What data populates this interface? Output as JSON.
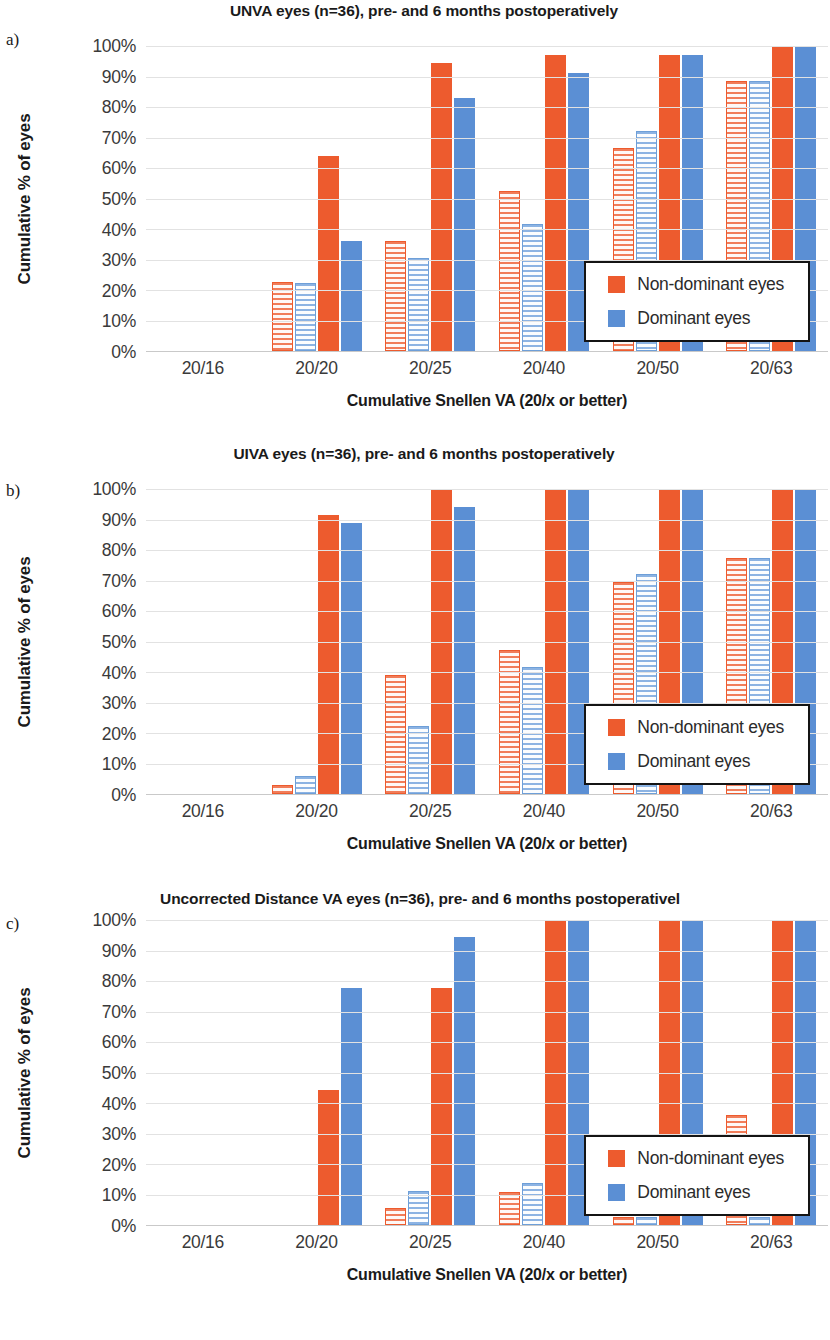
{
  "figure": {
    "panel_letters": [
      "a)",
      "b)",
      "c)"
    ]
  },
  "axis": {
    "ylabel": "Cumulative % of eyes",
    "xlabel": "Cumulative Snellen VA (20/x or better)",
    "yticks": [
      "0%",
      "10%",
      "20%",
      "30%",
      "40%",
      "50%",
      "60%",
      "70%",
      "80%",
      "90%",
      "100%"
    ],
    "xticks": [
      "20/16",
      "20/20",
      "20/25",
      "20/40",
      "20/50",
      "20/63"
    ]
  },
  "legend": {
    "items": [
      {
        "label": "Non-dominant eyes",
        "color": "#ed5b2e",
        "swatch": "nd"
      },
      {
        "label": "Dominant eyes",
        "color": "#5b8fd4",
        "swatch": "d"
      }
    ]
  },
  "colors": {
    "non_dominant": "#ed5b2e",
    "dominant": "#5b8fd4",
    "non_dominant_pre": "#f6a68f",
    "dominant_pre": "#bed8f2",
    "gridline": "#e2e2e2",
    "axis": "#c9c9c9"
  },
  "chart_data": [
    {
      "id": "panel-a",
      "type": "bar",
      "title": "UNVA eyes (n=36), pre- and 6 months postoperatively",
      "xlabel": "Cumulative Snellen VA (20/x or better)",
      "ylabel": "Cumulative % of eyes",
      "ylim": [
        0,
        100
      ],
      "ytick_step": 10,
      "grid": true,
      "legend_position": "inside-right",
      "categories": [
        "20/16",
        "20/20",
        "20/25",
        "20/40",
        "20/50",
        "20/63"
      ],
      "series": [
        {
          "name": "Non-dominant eyes preoperative",
          "style": "hatched",
          "color": "#ed5b2e",
          "values": [
            0,
            22.5,
            36,
            52.5,
            66.5,
            88.5
          ]
        },
        {
          "name": "Dominant eyes preoperative",
          "style": "hatched",
          "color": "#5b8fd4",
          "values": [
            0,
            22.2,
            30.5,
            41.5,
            72,
            88.5
          ]
        },
        {
          "name": "Non-dominant eyes postoperative",
          "style": "solid",
          "color": "#ed5b2e",
          "values": [
            0,
            63.8,
            94.4,
            97,
            97,
            100
          ]
        },
        {
          "name": "Dominant eyes postoperative",
          "style": "solid",
          "color": "#5b8fd4",
          "values": [
            0,
            36,
            83,
            91,
            97,
            100
          ]
        }
      ]
    },
    {
      "id": "panel-b",
      "type": "bar",
      "title": "UIVA eyes (n=36), pre- and 6 months postoperatively",
      "xlabel": "Cumulative Snellen VA (20/x or better)",
      "ylabel": "Cumulative % of eyes",
      "ylim": [
        0,
        100
      ],
      "ytick_step": 10,
      "grid": true,
      "legend_position": "inside-right",
      "categories": [
        "20/16",
        "20/20",
        "20/25",
        "20/40",
        "20/50",
        "20/63"
      ],
      "series": [
        {
          "name": "Non-dominant eyes preoperative",
          "style": "hatched",
          "color": "#ed5b2e",
          "values": [
            0,
            2.8,
            39,
            47.2,
            69.5,
            77.5
          ]
        },
        {
          "name": "Dominant eyes preoperative",
          "style": "hatched",
          "color": "#5b8fd4",
          "values": [
            0,
            5.8,
            22.2,
            41.5,
            72,
            77.5
          ]
        },
        {
          "name": "Non-dominant eyes postoperative",
          "style": "solid",
          "color": "#ed5b2e",
          "values": [
            0,
            91.6,
            100,
            100,
            100,
            100
          ]
        },
        {
          "name": "Dominant eyes postoperative",
          "style": "solid",
          "color": "#5b8fd4",
          "values": [
            0,
            88.9,
            94,
            100,
            100,
            100
          ]
        }
      ]
    },
    {
      "id": "panel-c",
      "type": "bar",
      "title": "Uncorrected Distance VA eyes (n=36), pre- and 6 months postoperativel",
      "xlabel": "Cumulative Snellen VA (20/x or better)",
      "ylabel": "Cumulative % of eyes",
      "ylim": [
        0,
        100
      ],
      "ytick_step": 10,
      "grid": true,
      "legend_position": "inside-right",
      "categories": [
        "20/16",
        "20/20",
        "20/25",
        "20/40",
        "20/50",
        "20/63"
      ],
      "series": [
        {
          "name": "Non-dominant eyes preoperative",
          "style": "hatched",
          "color": "#ed5b2e",
          "values": [
            0,
            0,
            5.5,
            10.8,
            2.5,
            36
          ]
        },
        {
          "name": "Dominant eyes preoperative",
          "style": "hatched",
          "color": "#5b8fd4",
          "values": [
            0,
            0,
            11,
            13.8,
            2.5,
            2.5
          ]
        },
        {
          "name": "Non-dominant eyes postoperative",
          "style": "solid",
          "color": "#ed5b2e",
          "values": [
            0,
            44.4,
            77.7,
            100,
            100,
            100
          ]
        },
        {
          "name": "Dominant eyes postoperative",
          "style": "solid",
          "color": "#5b8fd4",
          "values": [
            0,
            77.7,
            94.4,
            100,
            100,
            100
          ]
        }
      ]
    }
  ]
}
